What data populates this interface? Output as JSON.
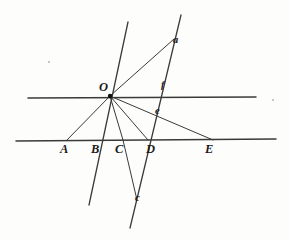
{
  "figure": {
    "canvas": {
      "width": 289,
      "height": 240,
      "background": "#fdfdfc"
    },
    "ink_color": "#2b2b2b",
    "line_color": "#3a3a3a",
    "vertex_color": "#111111",
    "points": [
      {
        "id": "O",
        "label": "O",
        "kind": "capital",
        "x": 110,
        "y": 96,
        "label_x": 99,
        "label_y": 81,
        "marked": true
      },
      {
        "id": "A",
        "label": "A",
        "kind": "capital",
        "x": 67,
        "y": 140,
        "label_x": 60,
        "label_y": 143,
        "marked": false
      },
      {
        "id": "B",
        "label": "B",
        "kind": "capital",
        "x": 98,
        "y": 140,
        "label_x": 91,
        "label_y": 143,
        "marked": false
      },
      {
        "id": "C",
        "label": "C",
        "kind": "capital",
        "x": 123,
        "y": 140,
        "label_x": 115,
        "label_y": 143,
        "marked": false
      },
      {
        "id": "D",
        "label": "D",
        "kind": "capital",
        "x": 148,
        "y": 140,
        "label_x": 146,
        "label_y": 143,
        "marked": false
      },
      {
        "id": "E",
        "label": "E",
        "kind": "capital",
        "x": 213,
        "y": 140,
        "label_x": 205,
        "label_y": 143,
        "marked": false
      },
      {
        "id": "a",
        "label": "a",
        "kind": "lowercase",
        "x": 171,
        "y": 40,
        "label_x": 173,
        "label_y": 35,
        "marked": false
      },
      {
        "id": "f",
        "label": "f",
        "kind": "lowercase",
        "x": 160,
        "y": 90,
        "label_x": 161,
        "label_y": 80,
        "marked": false
      },
      {
        "id": "e",
        "label": "e",
        "kind": "lowercase",
        "x": 153,
        "y": 112,
        "label_x": 155,
        "label_y": 106,
        "marked": false
      },
      {
        "id": "c",
        "label": "c",
        "kind": "lowercase",
        "x": 133,
        "y": 198,
        "label_x": 135,
        "label_y": 193,
        "marked": false
      }
    ],
    "lines": [
      {
        "id": "upper-transversal",
        "name": "horizontal-line-through-O",
        "x1": 28,
        "y1": 98,
        "x2": 256,
        "y2": 97,
        "width": 1.5
      },
      {
        "id": "lower-transversal",
        "name": "horizontal-line-ABCDE",
        "x1": 16,
        "y1": 141,
        "x2": 276,
        "y2": 139,
        "width": 1.5
      },
      {
        "id": "ray-O-A",
        "name": "ray-from-O-to-A",
        "x1": 110,
        "y1": 96,
        "x2": 67,
        "y2": 140,
        "width": 1.0
      },
      {
        "id": "ray-O-C",
        "name": "ray-from-O-to-C",
        "x1": 110,
        "y1": 96,
        "x2": 123,
        "y2": 140,
        "width": 1.0
      },
      {
        "id": "ray-O-D",
        "name": "ray-from-O-to-D",
        "x1": 110,
        "y1": 96,
        "x2": 148,
        "y2": 140,
        "width": 1.0
      },
      {
        "id": "ray-O-a",
        "name": "ray-from-O-through-a",
        "x1": 110,
        "y1": 96,
        "x2": 174,
        "y2": 39,
        "width": 1.0
      },
      {
        "id": "ray-O-E",
        "name": "ray-from-O-through-e-to-E",
        "x1": 110,
        "y1": 96,
        "x2": 213,
        "y2": 140,
        "width": 1.0
      },
      {
        "id": "steep-line-B",
        "name": "steep-line-through-B-and-c",
        "x1": 128,
        "y1": 22,
        "x2": 89,
        "y2": 205,
        "width": 1.3
      },
      {
        "id": "steep-line-f",
        "name": "steep-line-through-a-f-D-and-c",
        "x1": 181,
        "y1": 15,
        "x2": 130,
        "y2": 228,
        "width": 1.3
      },
      {
        "id": "seg-C-c",
        "name": "segment-from-C-down-to-c",
        "x1": 123,
        "y1": 140,
        "x2": 137,
        "y2": 200,
        "width": 1.0
      }
    ],
    "specks": [
      {
        "x": 48,
        "y": 61,
        "size": 2
      },
      {
        "x": 272,
        "y": 99,
        "size": 2
      }
    ]
  }
}
